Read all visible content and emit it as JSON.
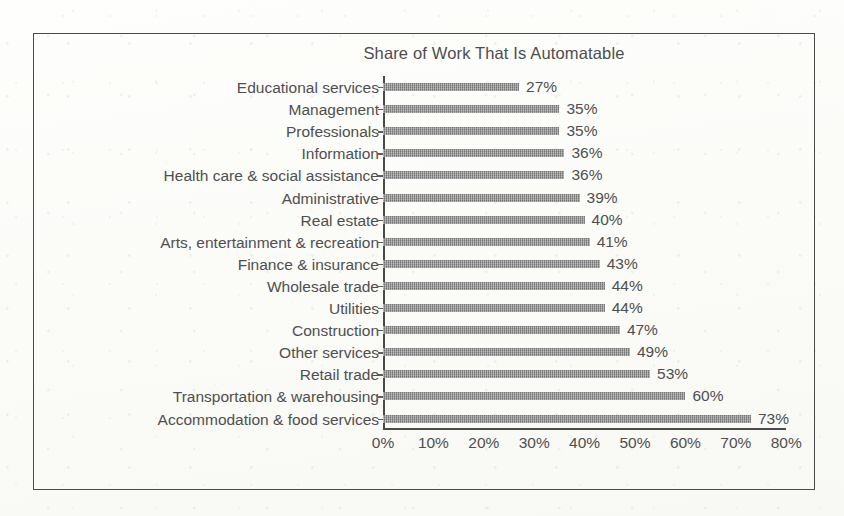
{
  "chart_data": {
    "type": "bar",
    "orientation": "horizontal",
    "title": "Share of Work That Is Automatable",
    "xlabel": "",
    "ylabel": "",
    "xlim": [
      0,
      80
    ],
    "grid": false,
    "legend": false,
    "value_suffix": "%",
    "categories": [
      "Educational services",
      "Management",
      "Professionals",
      "Information",
      "Health care & social assistance",
      "Administrative",
      "Real estate",
      "Arts, entertainment & recreation",
      "Finance & insurance",
      "Wholesale trade",
      "Utilities",
      "Construction",
      "Other services",
      "Retail trade",
      "Transportation & warehousing",
      "Accommodation & food services"
    ],
    "values": [
      27,
      35,
      35,
      36,
      36,
      39,
      40,
      41,
      43,
      44,
      44,
      47,
      49,
      53,
      60,
      73
    ],
    "value_labels": [
      "27%",
      "35%",
      "35%",
      "36%",
      "36%",
      "39%",
      "40%",
      "41%",
      "43%",
      "44%",
      "44%",
      "47%",
      "49%",
      "53%",
      "60%",
      "73%"
    ],
    "xticks": [
      0,
      10,
      20,
      30,
      40,
      50,
      60,
      70,
      80
    ],
    "xtick_labels": [
      "0%",
      "10%",
      "20%",
      "30%",
      "40%",
      "50%",
      "60%",
      "70%",
      "80%"
    ],
    "colors": {
      "bar": "#8c8c8c",
      "axis": "#4a4a4a",
      "text": "#4f4f4f",
      "background": "#fdfdfb",
      "frame": "#4a4a4a"
    }
  }
}
